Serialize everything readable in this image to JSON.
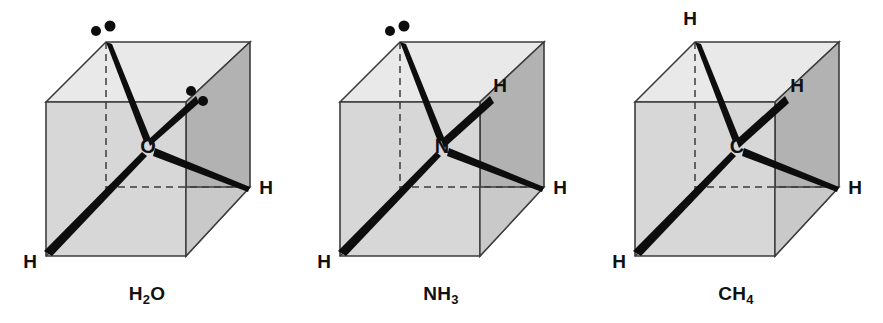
{
  "figure": {
    "background_color": "#ffffff",
    "width": 883,
    "height": 323
  },
  "style": {
    "cube_top_face_color": "#e9e9e9",
    "cube_front_face_color": "#d7d7d7",
    "cube_right_face_color": "#b2b2b2",
    "cube_inner_wedge_color": "#c2c2c2",
    "cube_edge_color": "#3c3c3c",
    "dashed_edge_color": "#3c3c3c",
    "bond_color": "#0d0d0d",
    "lone_pair_dot_color": "#0d0d0d",
    "text_color": "#111111"
  },
  "geometry": {
    "cube": {
      "front_top_left": [
        46,
        102
      ],
      "front_top_right": [
        186,
        102
      ],
      "front_bottom_left": [
        46,
        256
      ],
      "front_bottom_right": [
        186,
        256
      ],
      "back_top_left": [
        106,
        42
      ],
      "back_top_right": [
        250,
        42
      ],
      "back_bottom_right": [
        250,
        187
      ],
      "back_bottom_left_hidden": [
        106,
        198
      ]
    },
    "center_atom": [
      148,
      146
    ],
    "corner_targets": {
      "back_top_left": [
        106,
        42
      ],
      "back_bottom_right_corner": [
        250,
        187
      ],
      "front_bottom_left": [
        46,
        256
      ],
      "upper_right_interior": [
        196,
        96
      ]
    }
  },
  "molecules": [
    {
      "id": "water",
      "formula_main": "H",
      "formula_sub1": "2",
      "formula_main2": "O",
      "caption": "H2O",
      "center_atom_symbol": "O",
      "panel_x": 0,
      "bonds": [
        {
          "name": "bond-to-back-top-left",
          "to": [
            106,
            42
          ],
          "label": null
        },
        {
          "name": "bond-to-front-bottom-left",
          "to": [
            46,
            256
          ],
          "label": "H"
        }
      ],
      "wedge_bonds": [
        {
          "name": "wedge-to-back-bottom-right",
          "to": [
            250,
            187
          ],
          "label": "H"
        }
      ],
      "hydrogen_labels": [
        {
          "text": "H",
          "x": 264,
          "y": 194
        },
        {
          "text": "H",
          "x": 30,
          "y": 266
        }
      ],
      "lone_pairs": [
        {
          "name": "lone-pair-upper-left",
          "dots": [
            [
              96,
              31
            ],
            [
              109,
              27
            ]
          ]
        },
        {
          "name": "lone-pair-upper-right",
          "dots": [
            [
              191,
              91
            ],
            [
              202,
              100
            ]
          ]
        }
      ],
      "lone_pair_count": 2,
      "bonded_hydrogen_count": 2
    },
    {
      "id": "ammonia",
      "formula_main": "N",
      "formula_sub1": "H",
      "formula_main2": "3",
      "caption": "NH3",
      "center_atom_symbol": "N",
      "panel_x": 294,
      "bonds": [
        {
          "name": "bond-to-back-top-left",
          "to": [
            106,
            42
          ],
          "label": null
        },
        {
          "name": "bond-to-upper-right",
          "to": [
            196,
            96
          ],
          "label": "H"
        },
        {
          "name": "bond-to-front-bottom-left",
          "to": [
            46,
            256
          ],
          "label": "H"
        }
      ],
      "wedge_bonds": [
        {
          "name": "wedge-to-back-bottom-right",
          "to": [
            250,
            187
          ],
          "label": "H"
        }
      ],
      "hydrogen_labels": [
        {
          "text": "H",
          "x": 203,
          "y": 92
        },
        {
          "text": "H",
          "x": 264,
          "y": 194
        },
        {
          "text": "H",
          "x": 30,
          "y": 266
        }
      ],
      "lone_pairs": [
        {
          "name": "lone-pair-upper-left",
          "dots": [
            [
              96,
              31
            ],
            [
              109,
              27
            ]
          ]
        }
      ],
      "lone_pair_count": 1,
      "bonded_hydrogen_count": 3
    },
    {
      "id": "methane",
      "formula_main": "C",
      "formula_sub1": "H",
      "formula_main2": "4",
      "caption": "CH4",
      "center_atom_symbol": "C",
      "panel_x": 589,
      "bonds": [
        {
          "name": "bond-to-back-top-left",
          "to": [
            106,
            42
          ],
          "label": "H"
        },
        {
          "name": "bond-to-upper-right",
          "to": [
            196,
            96
          ],
          "label": "H"
        },
        {
          "name": "bond-to-front-bottom-left",
          "to": [
            46,
            256
          ],
          "label": "H"
        }
      ],
      "wedge_bonds": [
        {
          "name": "wedge-to-back-bottom-right",
          "to": [
            250,
            187
          ],
          "label": "H"
        }
      ],
      "hydrogen_labels": [
        {
          "text": "H",
          "x": 99,
          "y": 25
        },
        {
          "text": "H",
          "x": 205,
          "y": 92
        },
        {
          "text": "H",
          "x": 264,
          "y": 194
        },
        {
          "text": "H",
          "x": 30,
          "y": 266
        }
      ],
      "lone_pairs": [],
      "lone_pair_count": 0,
      "bonded_hydrogen_count": 4
    }
  ]
}
